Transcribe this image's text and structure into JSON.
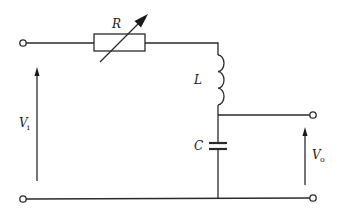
{
  "diagram": {
    "type": "circuit",
    "colors": {
      "line": "#2a2a2a",
      "background": "#ffffff"
    },
    "components": [
      {
        "id": "R",
        "label": "R",
        "kind": "variable-resistor"
      },
      {
        "id": "L",
        "label": "L",
        "kind": "inductor"
      },
      {
        "id": "C",
        "label": "C",
        "kind": "capacitor"
      }
    ],
    "voltages": {
      "input": {
        "symbol": "V",
        "subscript": "i"
      },
      "output": {
        "symbol": "V",
        "subscript": "o"
      }
    },
    "terminals": [
      "input-top",
      "input-bottom",
      "output-top",
      "output-bottom"
    ]
  }
}
